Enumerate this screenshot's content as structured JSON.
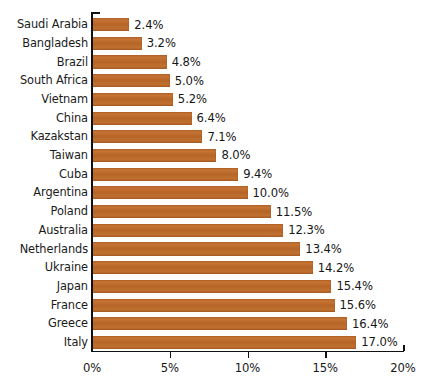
{
  "chart_data": {
    "type": "bar",
    "orientation": "horizontal",
    "title": "",
    "subtitle": "",
    "xlabel": "",
    "ylabel": "",
    "xlim": [
      0,
      20
    ],
    "grid": false,
    "legend": null,
    "bar_color": "#b9682b",
    "text_color": "#161616",
    "axis_color": "#111111",
    "value_suffix": "%",
    "xticks": [
      0,
      5,
      10,
      15,
      20
    ],
    "xtick_labels": [
      "0%",
      "5%",
      "10%",
      "15%",
      "20%"
    ],
    "categories": [
      "Saudi Arabia",
      "Bangladesh",
      "Brazil",
      "South Africa",
      "Vietnam",
      "China",
      "Kazakstan",
      "Taiwan",
      "Cuba",
      "Argentina",
      "Poland",
      "Australia",
      "Netherlands",
      "Ukraine",
      "Japan",
      "France",
      "Greece",
      "Italy"
    ],
    "values": [
      2.4,
      3.2,
      4.8,
      5.0,
      5.2,
      6.4,
      7.1,
      8.0,
      9.4,
      10.0,
      11.5,
      12.3,
      13.4,
      14.2,
      15.4,
      15.6,
      16.4,
      17.0
    ],
    "data_labels": [
      "2.4%",
      "3.2%",
      "4.8%",
      "5.0%",
      "5.2%",
      "6.4%",
      "7.1%",
      "8.0%",
      "9.4%",
      "10.0%",
      "11.5%",
      "12.3%",
      "13.4%",
      "14.2%",
      "15.4%",
      "15.6%",
      "16.4%",
      "17.0%"
    ]
  }
}
